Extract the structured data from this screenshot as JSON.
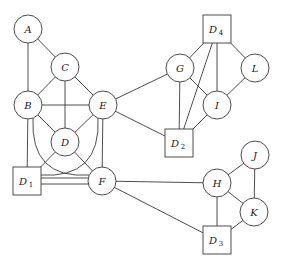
{
  "diagram": {
    "type": "undirected-graph",
    "nodes": [
      {
        "id": "A",
        "label": "A",
        "sub": "",
        "shape": "circle",
        "x": 28,
        "y": 29
      },
      {
        "id": "C",
        "label": "C",
        "sub": "",
        "shape": "circle",
        "x": 65,
        "y": 67
      },
      {
        "id": "B",
        "label": "B",
        "sub": "",
        "shape": "circle",
        "x": 28,
        "y": 105
      },
      {
        "id": "E",
        "label": "E",
        "sub": "",
        "shape": "circle",
        "x": 103,
        "y": 105
      },
      {
        "id": "D",
        "label": "D",
        "sub": "",
        "shape": "circle",
        "x": 65,
        "y": 142
      },
      {
        "id": "D1",
        "label": "D",
        "sub": "1",
        "shape": "square",
        "x": 27,
        "y": 181
      },
      {
        "id": "F",
        "label": "F",
        "sub": "",
        "shape": "circle",
        "x": 102,
        "y": 181
      },
      {
        "id": "D4",
        "label": "D",
        "sub": "4",
        "shape": "square",
        "x": 217,
        "y": 29
      },
      {
        "id": "G",
        "label": "G",
        "sub": "",
        "shape": "circle",
        "x": 180,
        "y": 68
      },
      {
        "id": "L",
        "label": "L",
        "sub": "",
        "shape": "circle",
        "x": 255,
        "y": 68
      },
      {
        "id": "I",
        "label": "I",
        "sub": "",
        "shape": "circle",
        "x": 217,
        "y": 105
      },
      {
        "id": "D2",
        "label": "D",
        "sub": "2",
        "shape": "square",
        "x": 179,
        "y": 143
      },
      {
        "id": "J",
        "label": "J",
        "sub": "",
        "shape": "circle",
        "x": 255,
        "y": 155
      },
      {
        "id": "H",
        "label": "H",
        "sub": "",
        "shape": "circle",
        "x": 217,
        "y": 183
      },
      {
        "id": "K",
        "label": "K",
        "sub": "",
        "shape": "circle",
        "x": 254,
        "y": 212
      },
      {
        "id": "D3",
        "label": "D",
        "sub": "3",
        "shape": "square",
        "x": 217,
        "y": 240
      }
    ],
    "edges": [
      {
        "from": "A",
        "to": "B",
        "style": "straight"
      },
      {
        "from": "A",
        "to": "C",
        "style": "straight"
      },
      {
        "from": "C",
        "to": "B",
        "style": "straight"
      },
      {
        "from": "C",
        "to": "E",
        "style": "straight"
      },
      {
        "from": "C",
        "to": "D",
        "style": "straight"
      },
      {
        "from": "B",
        "to": "E",
        "style": "straight"
      },
      {
        "from": "B",
        "to": "D",
        "style": "straight"
      },
      {
        "from": "E",
        "to": "D",
        "style": "straight"
      },
      {
        "from": "B",
        "to": "D1",
        "style": "straight"
      },
      {
        "from": "B",
        "to": "F",
        "style": "curved"
      },
      {
        "from": "E",
        "to": "D1",
        "style": "curved"
      },
      {
        "from": "E",
        "to": "F",
        "style": "straight"
      },
      {
        "from": "D",
        "to": "D1",
        "style": "straight"
      },
      {
        "from": "D",
        "to": "F",
        "style": "straight"
      },
      {
        "from": "D1",
        "to": "F",
        "style": "double"
      },
      {
        "from": "E",
        "to": "G",
        "style": "straight"
      },
      {
        "from": "E",
        "to": "D2",
        "style": "straight"
      },
      {
        "from": "D4",
        "to": "G",
        "style": "straight"
      },
      {
        "from": "D4",
        "to": "D2",
        "style": "straight"
      },
      {
        "from": "D4",
        "to": "I",
        "style": "straight"
      },
      {
        "from": "D4",
        "to": "L",
        "style": "straight"
      },
      {
        "from": "G",
        "to": "I",
        "style": "straight"
      },
      {
        "from": "G",
        "to": "D2",
        "style": "straight"
      },
      {
        "from": "L",
        "to": "I",
        "style": "straight"
      },
      {
        "from": "I",
        "to": "D2",
        "style": "straight"
      },
      {
        "from": "F",
        "to": "H",
        "style": "straight"
      },
      {
        "from": "F",
        "to": "D3",
        "style": "straight"
      },
      {
        "from": "H",
        "to": "J",
        "style": "straight"
      },
      {
        "from": "H",
        "to": "K",
        "style": "straight"
      },
      {
        "from": "J",
        "to": "K",
        "style": "straight"
      },
      {
        "from": "H",
        "to": "D3",
        "style": "straight"
      },
      {
        "from": "K",
        "to": "D3",
        "style": "straight"
      }
    ]
  },
  "style": {
    "stroke": "#3a3a3a",
    "background": "#ffffff",
    "circle_radius": 14,
    "square_half": 14
  }
}
